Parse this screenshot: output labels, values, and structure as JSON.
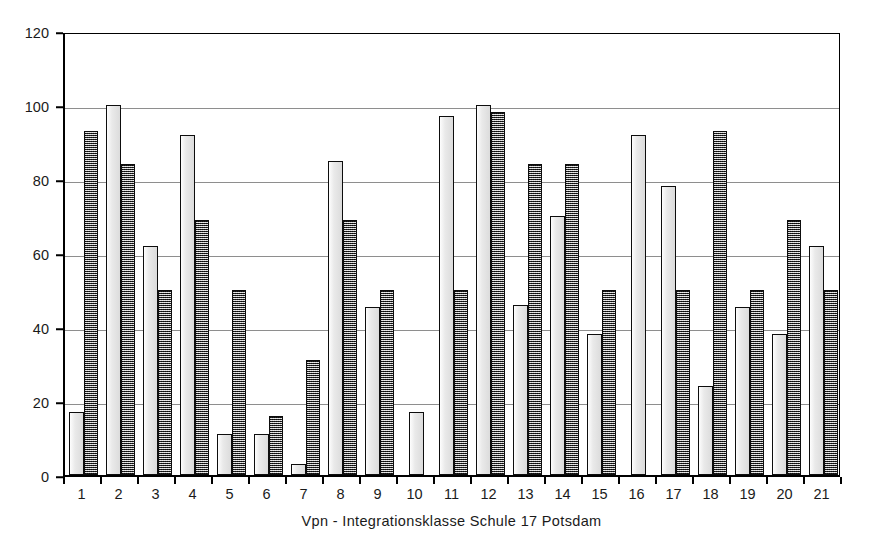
{
  "chart_data": {
    "type": "bar",
    "title": "",
    "subtitle": "",
    "xlabel": "Vpn - Integrationsklasse Schule 17 Potsdam",
    "ylabel": "",
    "ylim": [
      0,
      120
    ],
    "ytick_step": 20,
    "yticks": [
      0,
      20,
      40,
      60,
      80,
      100,
      120
    ],
    "ytick_labels": [
      "0",
      "20",
      "40",
      "60",
      "80",
      "100",
      "120"
    ],
    "grid": "horizontal",
    "legend": "none",
    "categories": [
      "1",
      "2",
      "3",
      "4",
      "5",
      "6",
      "7",
      "8",
      "9",
      "10",
      "11",
      "12",
      "13",
      "14",
      "15",
      "16",
      "17",
      "18",
      "19",
      "20",
      "21"
    ],
    "series": [
      {
        "name": "series-a",
        "style": "light-gray-solid",
        "color": "#e3e3e3",
        "values": [
          17,
          100,
          62,
          92,
          11,
          11,
          3,
          85,
          45.5,
          17,
          97,
          100,
          46,
          70,
          38,
          92,
          78,
          24,
          45.5,
          38,
          62
        ]
      },
      {
        "name": "series-b",
        "style": "dark-checkered",
        "color": "#6e6e6e",
        "values": [
          93,
          84,
          50,
          69,
          50,
          16,
          31,
          69,
          50,
          null,
          50,
          98,
          84,
          84,
          50,
          null,
          50,
          93,
          50,
          69,
          50
        ]
      }
    ]
  },
  "axis": {
    "x_title": "Vpn - Integrationsklasse Schule 17 Potsdam"
  }
}
